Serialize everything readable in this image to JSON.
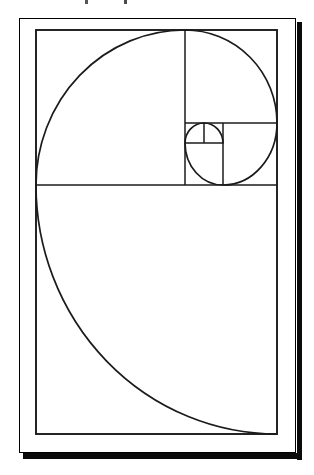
{
  "figure": {
    "canvas": {
      "width": 314,
      "height": 475,
      "background": "#ffffff"
    },
    "sheet": {
      "x": 19,
      "y": 18,
      "width": 275,
      "height": 433,
      "border_color": "#8f8f8f",
      "background": "#ffffff"
    },
    "drop_shadow": {
      "color": "#0a0a0a",
      "right": {
        "x": 297,
        "y": 22,
        "width": 5,
        "height": 438
      },
      "bottom": {
        "x": 23,
        "y": 453,
        "width": 279,
        "height": 6
      }
    },
    "line_color": "#1b1b1b",
    "inner_rect": {
      "x": 36,
      "y": 30,
      "width": 241,
      "height": 404,
      "stroke_width": 1.9
    },
    "dividers": {
      "stroke_width": 1.5,
      "segments": [
        {
          "name": "main-horizontal-divider",
          "x1": 36,
          "y1": 185,
          "x2": 277,
          "y2": 185
        },
        {
          "name": "main-vertical-divider",
          "x1": 185,
          "y1": 30,
          "x2": 185,
          "y2": 185
        },
        {
          "name": "right-column-horizontal",
          "x1": 185,
          "y1": 123,
          "x2": 277,
          "y2": 123
        },
        {
          "name": "strip-vertical-divider",
          "x1": 223,
          "y1": 123,
          "x2": 223,
          "y2": 185
        },
        {
          "name": "small-horizontal-divider",
          "x1": 185,
          "y1": 143,
          "x2": 223,
          "y2": 143
        },
        {
          "name": "small-vertical-divider",
          "x1": 204,
          "y1": 123,
          "x2": 204,
          "y2": 143
        }
      ]
    },
    "spiral": {
      "stroke_width": 1.7,
      "sweep": 0,
      "start": [
        223,
        143
      ],
      "arcs": [
        {
          "rx": 19,
          "ry": 20,
          "to": [
            204,
            123
          ]
        },
        {
          "rx": 19,
          "ry": 20,
          "to": [
            185,
            143
          ]
        },
        {
          "rx": 38,
          "ry": 42,
          "to": [
            223,
            185
          ]
        },
        {
          "rx": 54,
          "ry": 62,
          "to": [
            277,
            123
          ]
        },
        {
          "rx": 92,
          "ry": 93,
          "to": [
            185,
            30
          ]
        },
        {
          "rx": 149,
          "ry": 155,
          "to": [
            36,
            185
          ]
        },
        {
          "rx": 241,
          "ry": 249,
          "to": [
            277,
            434
          ]
        }
      ]
    },
    "clipped_text_fragments": [
      {
        "x": 85,
        "y": 0,
        "width": 3,
        "height": 4,
        "color": "#555555"
      },
      {
        "x": 124,
        "y": 0,
        "width": 3,
        "height": 4,
        "color": "#4a4a4a"
      }
    ]
  }
}
